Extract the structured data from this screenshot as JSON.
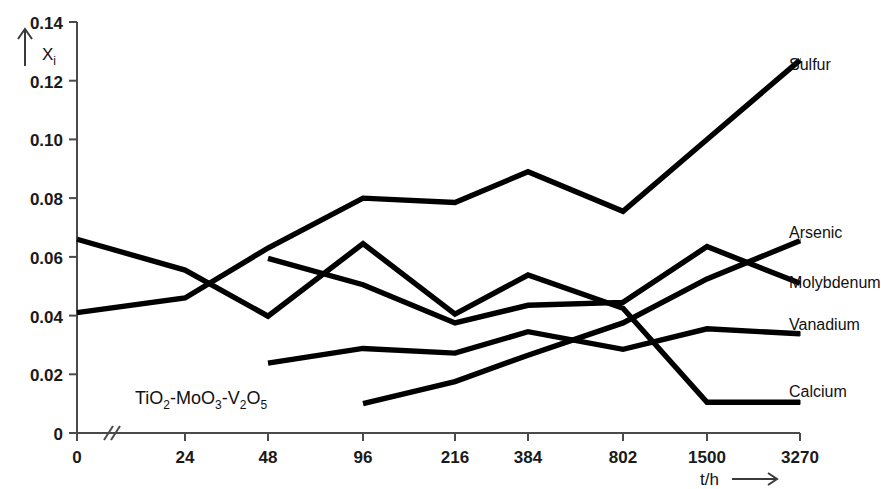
{
  "chart_data": {
    "type": "line",
    "title": "",
    "subtitle": "",
    "annotation": "TiO2-MoO3-V2O5",
    "annotation_parts": [
      {
        "t": "TiO",
        "sub": "2"
      },
      {
        "t": "-MoO",
        "sub": "3"
      },
      {
        "t": "-V",
        "sub": "2"
      },
      {
        "t": "O",
        "sub": "5"
      }
    ],
    "xlabel": "t/h",
    "xlabel_arrow": "⟶",
    "ylabel": "X",
    "ylabel_sub": "i",
    "ylabel_arrow": "↑",
    "x_axis_break": true,
    "grid": false,
    "legend_position": "right-inline-labels",
    "categories": [
      "0",
      "24",
      "48",
      "96",
      "216",
      "384",
      "802",
      "1500",
      "3270"
    ],
    "x_tick_labels": [
      "0",
      "24",
      "48",
      "96",
      "216",
      "384",
      "802",
      "1500",
      "3270"
    ],
    "y_tick_labels": [
      "0",
      "0.02",
      "0.04",
      "0.06",
      "0.08",
      "0.10",
      "0.12",
      "0.14"
    ],
    "y_tick_values": [
      0,
      0.02,
      0.04,
      0.06,
      0.08,
      0.1,
      0.12,
      0.14
    ],
    "ylim": [
      0,
      0.14
    ],
    "series": [
      {
        "name": "Sulfur",
        "color": "#000000",
        "x": [
          "0",
          "24",
          "48",
          "96",
          "216",
          "384",
          "802",
          "1500",
          "3270"
        ],
        "values": [
          0.041,
          0.046,
          0.063,
          0.08,
          0.0785,
          0.089,
          0.0755,
          0.1,
          0.127
        ]
      },
      {
        "name": "Arsenic",
        "color": "#000000",
        "x": [
          "96",
          "216",
          "384",
          "802",
          "1500",
          "3270"
        ],
        "values": [
          0.01,
          0.0175,
          0.0265,
          0.0375,
          0.0525,
          0.0655
        ]
      },
      {
        "name": "Molybdenum",
        "color": "#000000",
        "x": [
          "48",
          "96",
          "216",
          "384",
          "802",
          "1500",
          "3270"
        ],
        "values": [
          0.0595,
          0.0505,
          0.0375,
          0.0435,
          0.0445,
          0.0635,
          0.051
        ]
      },
      {
        "name": "Vanadium",
        "color": "#000000",
        "x": [
          "48",
          "96",
          "216",
          "384",
          "802",
          "1500",
          "3270"
        ],
        "values": [
          0.0238,
          0.0288,
          0.0272,
          0.0345,
          0.0285,
          0.0355,
          0.0338
        ]
      },
      {
        "name": "Calcium",
        "color": "#000000",
        "x": [
          "0",
          "24",
          "48",
          "96",
          "216",
          "384",
          "802",
          "1500",
          "3270"
        ],
        "values": [
          0.066,
          0.0555,
          0.0398,
          0.0645,
          0.0405,
          0.0538,
          0.0425,
          0.0105,
          0.0105
        ]
      }
    ]
  },
  "axis": {
    "y_ticks": [
      "0.14",
      "0.12",
      "0.10",
      "0.08",
      "0.06",
      "0.04",
      "0.02",
      "0"
    ],
    "x_ticks": [
      "0",
      "24",
      "48",
      "96",
      "216",
      "384",
      "802",
      "1500",
      "3270"
    ],
    "x_title": "t/h",
    "x_arrow": "⟶",
    "y_title": "X",
    "y_title_sub": "i",
    "y_arrow": "↑"
  },
  "labels": {
    "sulfur": "Sulfur",
    "arsenic": "Arsenic",
    "molybdenum": "Molybdenum",
    "vanadium": "Vanadium",
    "calcium": "Calcium"
  },
  "annotation": {
    "formula_1": "TiO",
    "formula_1_sub": "2",
    "formula_2": "-MoO",
    "formula_2_sub": "3",
    "formula_3": "-V",
    "formula_3_sub": "2",
    "formula_4": "O",
    "formula_4_sub": "5"
  }
}
